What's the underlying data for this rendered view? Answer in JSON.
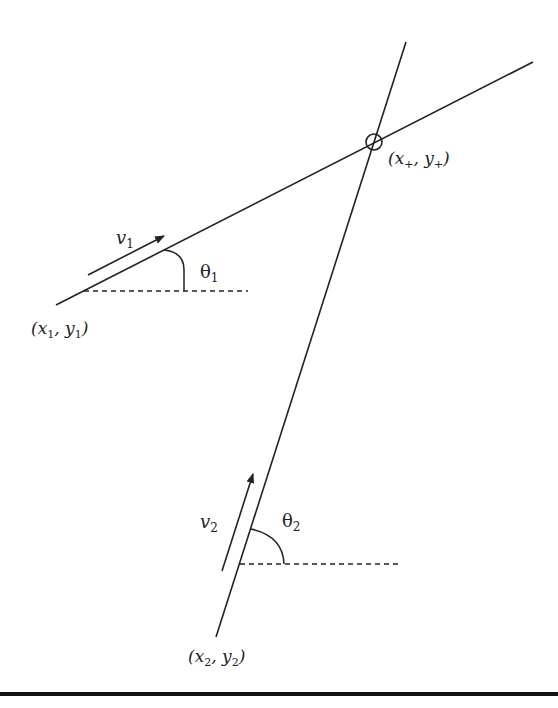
{
  "diagram": {
    "colors": {
      "stroke": "#222222",
      "background": "#ffffff",
      "bar": "#111111"
    },
    "intersection": {
      "label_main_x": "x",
      "label_sub_x": "+",
      "label_main_y": "y",
      "label_sub_y": "+",
      "point": [
        374,
        142
      ]
    },
    "line1": {
      "start": [
        56,
        305
      ],
      "end": [
        533,
        62
      ],
      "start_label_x": "x",
      "start_label_x_sub": "1",
      "start_label_y": "y",
      "start_label_y_sub": "1",
      "velocity_label": "v",
      "velocity_sub": "1",
      "angle_label": "θ",
      "angle_sub": "1"
    },
    "line2": {
      "start": [
        216,
        637
      ],
      "end": [
        406,
        42
      ],
      "start_label_x": "x",
      "start_label_x_sub": "2",
      "start_label_y": "y",
      "start_label_y_sub": "2",
      "velocity_label": "v",
      "velocity_sub": "2",
      "angle_label": "θ",
      "angle_sub": "2"
    }
  }
}
